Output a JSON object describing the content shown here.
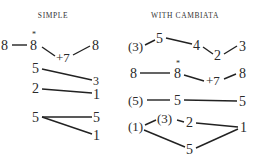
{
  "headers": {
    "simple": "SIMPLE",
    "cambiata": "WITH CAMBIATA"
  },
  "simple": {
    "row1": {
      "a": "8",
      "b": "8",
      "star": "*",
      "c": "+7",
      "d": "8"
    },
    "row2": {
      "a": "5",
      "b": "3"
    },
    "row3": {
      "a": "2",
      "b": "1"
    },
    "row4": {
      "a": "5",
      "b": "5",
      "c": "1"
    }
  },
  "cambiata": {
    "row1": {
      "a": "(3)",
      "b": "5",
      "c": "4",
      "d": "2",
      "e": "3"
    },
    "row2": {
      "a": "8",
      "b": "8",
      "star": "*",
      "c": "+7",
      "d": "8"
    },
    "row3": {
      "a": "(5)",
      "b": "5",
      "c": "5"
    },
    "row4": {
      "a": "(1)",
      "b": "(3)",
      "c": "2",
      "d": "1",
      "e": "5"
    }
  }
}
